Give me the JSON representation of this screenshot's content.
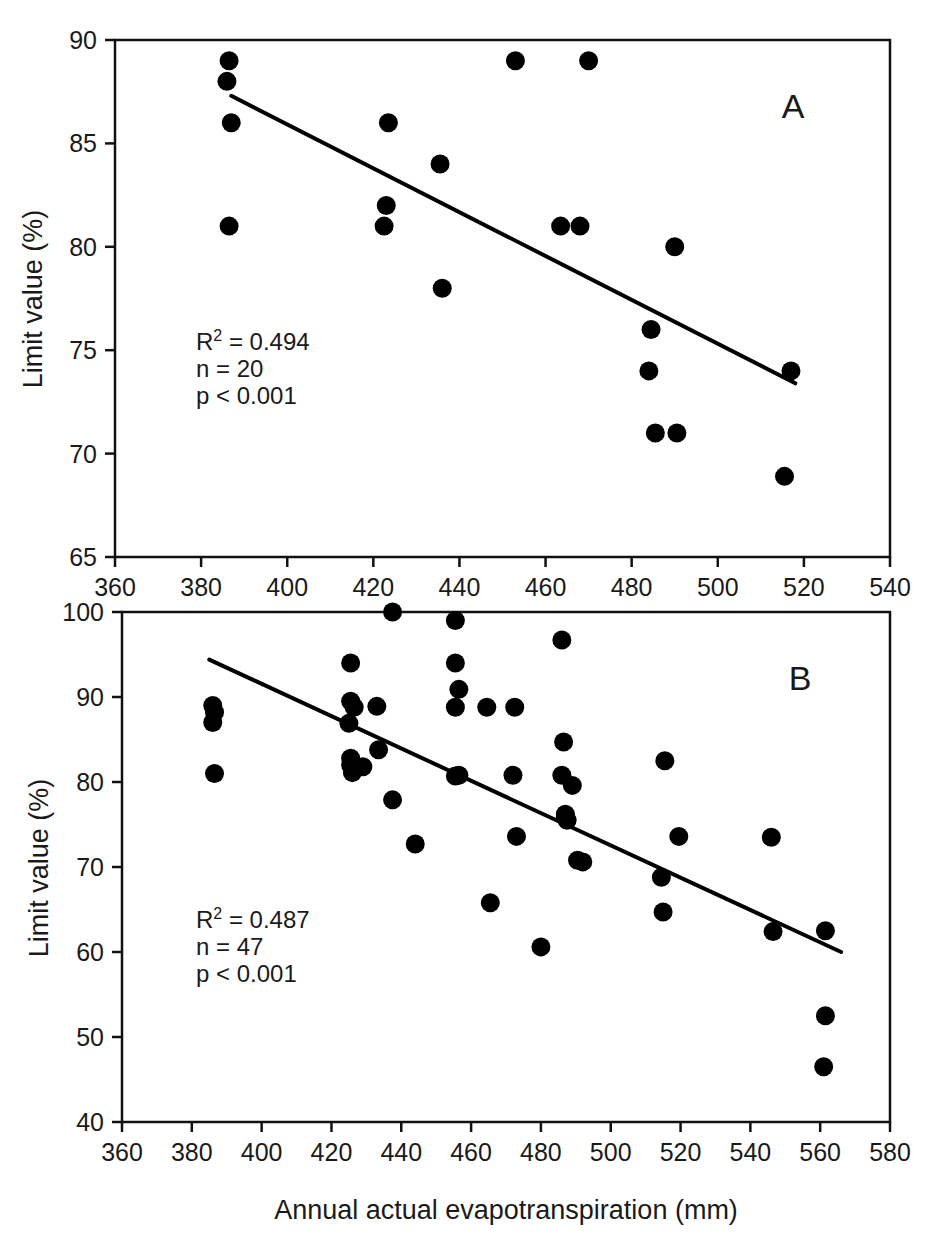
{
  "figure": {
    "xlabel": "Annual actual evapotranspiration (mm)",
    "ylabel_a": "Limit value (%)",
    "ylabel_b": "Limit value (%)"
  },
  "chart_data": [
    {
      "type": "scatter",
      "panel": "A",
      "title": "",
      "xlabel": "",
      "ylabel": "Limit value (%)",
      "xlim": [
        360,
        540
      ],
      "ylim": [
        65,
        90
      ],
      "xticks": [
        360,
        380,
        400,
        420,
        440,
        460,
        480,
        500,
        520,
        540
      ],
      "yticks": [
        65,
        70,
        75,
        80,
        85,
        90
      ],
      "grid": false,
      "legend": "none",
      "annotations": {
        "r2": "R2 = 0.494",
        "r2_base": "R",
        "r2_sup": "2",
        "r2_rest": " = 0.494",
        "n": "n = 20",
        "p": "p < 0.001",
        "panel_letter": "A"
      },
      "points": [
        {
          "x": 386.5,
          "y": 89.0
        },
        {
          "x": 386.0,
          "y": 88.0
        },
        {
          "x": 387.0,
          "y": 86.0
        },
        {
          "x": 386.5,
          "y": 81.0
        },
        {
          "x": 423.5,
          "y": 86.0
        },
        {
          "x": 423.0,
          "y": 82.0
        },
        {
          "x": 422.5,
          "y": 81.0
        },
        {
          "x": 435.5,
          "y": 84.0
        },
        {
          "x": 436.0,
          "y": 78.0
        },
        {
          "x": 453.0,
          "y": 89.0
        },
        {
          "x": 463.5,
          "y": 81.0
        },
        {
          "x": 470.0,
          "y": 89.0
        },
        {
          "x": 468.0,
          "y": 81.0
        },
        {
          "x": 484.5,
          "y": 76.0
        },
        {
          "x": 484.0,
          "y": 74.0
        },
        {
          "x": 485.5,
          "y": 71.0
        },
        {
          "x": 490.5,
          "y": 71.0
        },
        {
          "x": 490.0,
          "y": 80.0
        },
        {
          "x": 515.5,
          "y": 68.9
        },
        {
          "x": 517.0,
          "y": 74.0
        }
      ],
      "fit_line": {
        "x1": 387.0,
        "y1": 87.3,
        "x2": 518.0,
        "y2": 73.4
      }
    },
    {
      "type": "scatter",
      "panel": "B",
      "title": "",
      "xlabel": "Annual actual evapotranspiration (mm)",
      "ylabel": "Limit value (%)",
      "xlim": [
        360,
        580
      ],
      "ylim": [
        40,
        100
      ],
      "xticks": [
        360,
        380,
        400,
        420,
        440,
        460,
        480,
        500,
        520,
        540,
        560,
        580
      ],
      "yticks": [
        40,
        50,
        60,
        70,
        80,
        90,
        100
      ],
      "grid": false,
      "legend": "none",
      "annotations": {
        "r2": "R2 = 0.487",
        "r2_base": "R",
        "r2_sup": "2",
        "r2_rest": " = 0.487",
        "n": "n = 47",
        "p": "p < 0.001",
        "panel_letter": "B"
      },
      "points": [
        {
          "x": 386.0,
          "y": 89.0
        },
        {
          "x": 386.5,
          "y": 88.2
        },
        {
          "x": 386.0,
          "y": 87.0
        },
        {
          "x": 386.5,
          "y": 81.0
        },
        {
          "x": 425.5,
          "y": 94.0
        },
        {
          "x": 425.5,
          "y": 89.5
        },
        {
          "x": 426.5,
          "y": 88.8
        },
        {
          "x": 425.0,
          "y": 86.9
        },
        {
          "x": 425.5,
          "y": 82.8
        },
        {
          "x": 425.5,
          "y": 82.0
        },
        {
          "x": 426.0,
          "y": 81.1
        },
        {
          "x": 433.0,
          "y": 88.9
        },
        {
          "x": 433.5,
          "y": 83.8
        },
        {
          "x": 437.5,
          "y": 100.0
        },
        {
          "x": 437.5,
          "y": 77.9
        },
        {
          "x": 444.0,
          "y": 72.7
        },
        {
          "x": 455.5,
          "y": 99.0
        },
        {
          "x": 455.5,
          "y": 94.0
        },
        {
          "x": 456.5,
          "y": 90.9
        },
        {
          "x": 455.5,
          "y": 88.8
        },
        {
          "x": 455.5,
          "y": 80.7
        },
        {
          "x": 465.5,
          "y": 65.8
        },
        {
          "x": 464.5,
          "y": 88.8
        },
        {
          "x": 472.5,
          "y": 88.8
        },
        {
          "x": 472.0,
          "y": 80.8
        },
        {
          "x": 473.0,
          "y": 73.6
        },
        {
          "x": 480.0,
          "y": 60.6
        },
        {
          "x": 486.0,
          "y": 96.7
        },
        {
          "x": 486.5,
          "y": 84.7
        },
        {
          "x": 486.0,
          "y": 80.8
        },
        {
          "x": 487.0,
          "y": 76.2
        },
        {
          "x": 487.5,
          "y": 75.5
        },
        {
          "x": 489.0,
          "y": 79.6
        },
        {
          "x": 490.5,
          "y": 70.8
        },
        {
          "x": 492.0,
          "y": 70.6
        },
        {
          "x": 515.5,
          "y": 82.5
        },
        {
          "x": 514.5,
          "y": 68.8
        },
        {
          "x": 515.0,
          "y": 64.7
        },
        {
          "x": 519.5,
          "y": 73.6
        },
        {
          "x": 546.0,
          "y": 73.5
        },
        {
          "x": 546.5,
          "y": 62.4
        },
        {
          "x": 561.5,
          "y": 62.5
        },
        {
          "x": 561.5,
          "y": 52.5
        },
        {
          "x": 561.0,
          "y": 46.5
        },
        {
          "x": 429.0,
          "y": 81.8
        },
        {
          "x": 456.5,
          "y": 80.8
        },
        {
          "x": 487.0,
          "y": 75.9
        }
      ],
      "fit_line": {
        "x1": 385.0,
        "y1": 94.4,
        "x2": 566.0,
        "y2": 60.0
      }
    }
  ]
}
